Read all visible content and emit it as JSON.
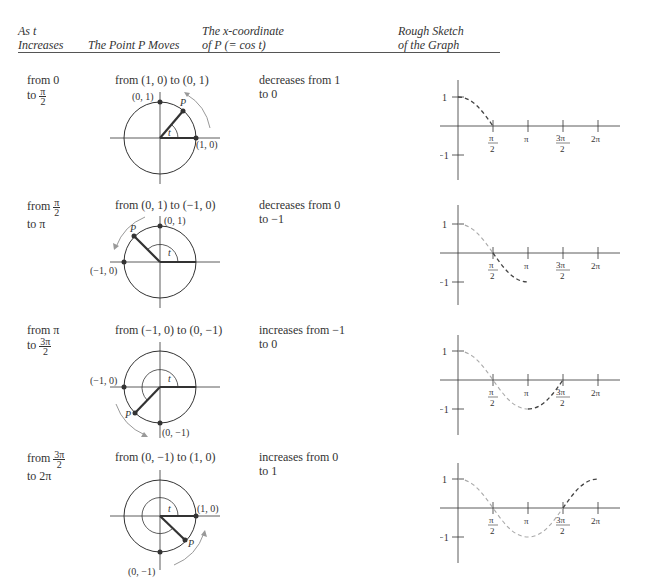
{
  "header": {
    "col1": [
      "As t",
      "Increases"
    ],
    "col2": "The Point P Moves",
    "col3": [
      "The x-coordinate",
      "of P (= cos t)"
    ],
    "col4": [
      "Rough Sketch",
      "of the Graph"
    ]
  },
  "rows": [
    {
      "interval_from": "from 0",
      "interval_to_prefix": "to",
      "interval_to_frac": {
        "num": "π",
        "den": "2"
      },
      "movement": "from (1, 0) to (0, 1)",
      "x_change": [
        "decreases from 1",
        "to 0"
      ],
      "circle_labels": {
        "top": "(0, 1)",
        "right": "(1, 0)",
        "point": "P",
        "angle": "t"
      }
    },
    {
      "interval_from_prefix": "from",
      "interval_from_frac": {
        "num": "π",
        "den": "2"
      },
      "interval_to": "to π",
      "movement": "from (0, 1) to (−1, 0)",
      "x_change": [
        "decreases from 0",
        "to −1"
      ],
      "circle_labels": {
        "top": "(0, 1)",
        "left": "(−1, 0)",
        "point": "P",
        "angle": "t"
      }
    },
    {
      "interval_from": "from π",
      "interval_to_prefix": "to",
      "interval_to_frac": {
        "num": "3π",
        "den": "2"
      },
      "movement": "from (−1, 0) to (0, −1)",
      "x_change": [
        "increases from −1",
        "to 0"
      ],
      "circle_labels": {
        "left": "(−1, 0)",
        "bottom": "(0, −1)",
        "point": "P",
        "angle": "t"
      }
    },
    {
      "interval_from_prefix": "from",
      "interval_from_frac": {
        "num": "3π",
        "den": "2"
      },
      "interval_to": "to 2π",
      "movement": "from (0, −1) to (1, 0)",
      "x_change": [
        "increases from 0",
        "to 1"
      ],
      "circle_labels": {
        "right": "(1, 0)",
        "bottom": "(0, −1)",
        "point": "P",
        "angle": "t"
      }
    }
  ],
  "graph_axis": {
    "y_ticks": [
      "1",
      "−1"
    ],
    "x_ticks": [
      {
        "num": "π",
        "den": "2"
      },
      {
        "label": "π"
      },
      {
        "num": "3π",
        "den": "2"
      },
      {
        "label": "2π"
      }
    ]
  },
  "colors": {
    "ink": "#333333",
    "arrow": "#999999",
    "curve_prev": "#aaaaaa",
    "curve_new": "#444444"
  }
}
